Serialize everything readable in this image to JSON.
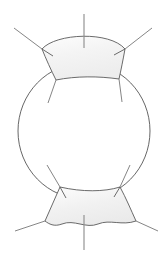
{
  "canvas": {
    "width": 166,
    "height": 264,
    "background": "#ffffff",
    "title": "Sphere with two curvilinear patches"
  },
  "style": {
    "stroke_color": "#555555",
    "stroke_color_light": "#777777",
    "stroke_width": 0.9,
    "patch_fill_top": "#f2f2f2",
    "patch_fill_bottom": "#efefef",
    "patch_fill_highlight": "#fcfcfc"
  },
  "chart_data": {
    "type": "diagram",
    "title": "Sphere with two curvilinear patches",
    "xlabel": "",
    "ylabel": "",
    "elements": [
      {
        "name": "sphere-outline",
        "kind": "circle",
        "cx": 84,
        "cy": 131,
        "rx": 66,
        "ry": 68
      },
      {
        "name": "top-patch",
        "kind": "filled-quad",
        "corners": [
          [
            42,
            49
          ],
          [
            125,
            49
          ],
          [
            119,
            79
          ],
          [
            56,
            80
          ]
        ],
        "top_edge_curve_peak": [
          84,
          33
        ]
      },
      {
        "name": "bottom-patch",
        "kind": "filled-quad",
        "corners": [
          [
            60,
            187
          ],
          [
            120,
            187
          ],
          [
            136,
            221
          ],
          [
            45,
            221
          ]
        ],
        "bottom_edge_wavy": true
      }
    ],
    "radiating_lines": [
      {
        "name": "top-left-outer",
        "from": [
          42,
          49
        ],
        "to": [
          14,
          28
        ]
      },
      {
        "name": "top-right-outer",
        "from": [
          125,
          49
        ],
        "to": [
          152,
          28
        ]
      },
      {
        "name": "top-left-inner",
        "from": [
          56,
          80
        ],
        "to": [
          48,
          103
        ]
      },
      {
        "name": "top-right-inner",
        "from": [
          119,
          79
        ],
        "to": [
          122,
          102
        ]
      },
      {
        "name": "bottom-left-inner",
        "from": [
          60,
          187
        ],
        "to": [
          47,
          165
        ]
      },
      {
        "name": "bottom-right-inner",
        "from": [
          120,
          187
        ],
        "to": [
          130,
          165
        ]
      },
      {
        "name": "bottom-left-outer",
        "from": [
          45,
          221
        ],
        "to": [
          15,
          231
        ]
      },
      {
        "name": "bottom-right-outer",
        "from": [
          136,
          221
        ],
        "to": [
          158,
          231
        ]
      }
    ],
    "tick_marks": [
      {
        "name": "top-center-tick",
        "x": 84,
        "y1": 14,
        "y2": 48
      },
      {
        "name": "bottom-center-tick",
        "x": 84,
        "y1": 215,
        "y2": 250
      }
    ],
    "legend": [],
    "annotations": []
  }
}
